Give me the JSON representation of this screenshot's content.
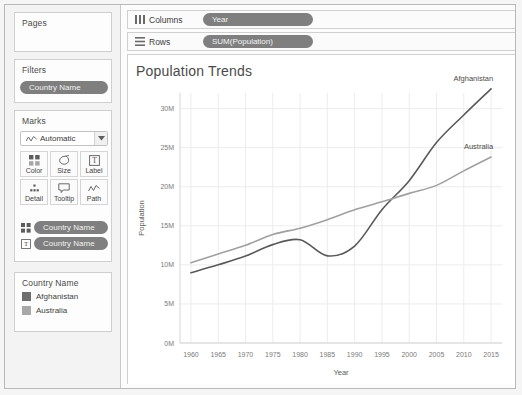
{
  "pages": {
    "title": "Pages"
  },
  "filters": {
    "title": "Filters",
    "pill": "Country Name"
  },
  "marks": {
    "title": "Marks",
    "mark_type": "Automatic",
    "mark_type_icon": "line-chart-icon",
    "caret_icon": "chevron-down-icon",
    "buttons": [
      {
        "label": "Color",
        "icon": "color-squares-icon"
      },
      {
        "label": "Size",
        "icon": "size-teardrop-icon"
      },
      {
        "label": "Label",
        "icon": "label-text-icon"
      },
      {
        "label": "Detail",
        "icon": "detail-dots-icon"
      },
      {
        "label": "Tooltip",
        "icon": "tooltip-bubble-icon"
      },
      {
        "label": "Path",
        "icon": "path-line-icon"
      }
    ],
    "pills": [
      {
        "label": "Country Name",
        "icon": "color-squares-icon"
      },
      {
        "label": "Country Name",
        "icon": "label-text-icon"
      }
    ]
  },
  "legend": {
    "title": "Country Name",
    "items": [
      {
        "label": "Afghanistan",
        "color": "#6e6e6e"
      },
      {
        "label": "Australia",
        "color": "#a8a8a8"
      }
    ]
  },
  "shelves": [
    {
      "name": "Columns",
      "icon": "columns-icon",
      "pill": "Year"
    },
    {
      "name": "Rows",
      "icon": "rows-icon",
      "pill": "SUM(Population)"
    }
  ],
  "chart_data": {
    "type": "line",
    "title": "Population Trends",
    "xlabel": "Year",
    "ylabel": "Population",
    "xlim": [
      1958,
      2017
    ],
    "ylim": [
      0,
      32000000
    ],
    "xticks": [
      1960,
      1965,
      1970,
      1975,
      1980,
      1985,
      1990,
      1995,
      2000,
      2005,
      2010,
      2015
    ],
    "xticklabels": [
      "1960",
      "1965",
      "1970",
      "1975",
      "1980",
      "1985",
      "1990",
      "1995",
      "2000",
      "2005",
      "2010",
      "2015"
    ],
    "yticks": [
      0,
      5000000,
      10000000,
      15000000,
      20000000,
      25000000,
      30000000
    ],
    "yticklabels": [
      "0M",
      "5M",
      "10M",
      "15M",
      "20M",
      "25M",
      "30M"
    ],
    "grid": true,
    "legend_position": "external-left",
    "x": [
      1960,
      1965,
      1970,
      1975,
      1980,
      1985,
      1990,
      1995,
      2000,
      2005,
      2010,
      2015
    ],
    "series": [
      {
        "name": "Afghanistan",
        "color": "#595959",
        "annotation": "Afghanistan",
        "values": [
          8996351,
          10009945,
          11126123,
          12590286,
          13211412,
          11155195,
          12412311,
          17065836,
          20779953,
          25654277,
          29185507,
          32526562
        ]
      },
      {
        "name": "Australia",
        "color": "#a0a0a0",
        "annotation": "Australia",
        "values": [
          10276477,
          11388000,
          12507000,
          13893000,
          14695000,
          15788000,
          17065100,
          18072000,
          19153000,
          20176844,
          22031750,
          23799556
        ]
      }
    ]
  }
}
